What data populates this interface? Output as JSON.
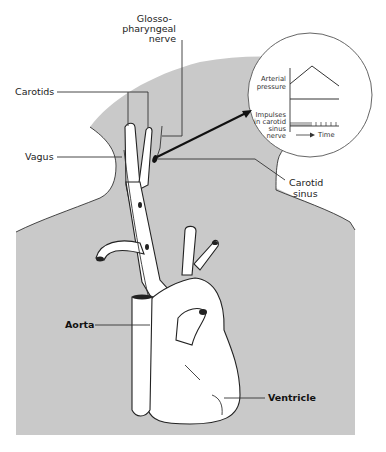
{
  "figure": {
    "colors": {
      "body_fill": "#c9c9c9",
      "background": "#ffffff",
      "ink": "#222222"
    },
    "labels": {
      "glossopharyngeal": [
        "Glosso-",
        "pharyngeal",
        "nerve"
      ],
      "carotids": "Carotids",
      "vagus": "Vagus",
      "carotid_sinus": [
        "Carotid",
        "sinus"
      ],
      "aorta": "Aorta",
      "ventricle": "Ventricle"
    },
    "inset": {
      "arterial_pressure": [
        "Arterial",
        "pressure"
      ],
      "impulses": [
        "Impulses",
        "in carotid",
        "sinus",
        "nerve"
      ],
      "time_label": "Time",
      "pressure_trace": "rises then falls",
      "impulse_trace": "dense impulses during pressure rise, sparse during fall"
    }
  }
}
